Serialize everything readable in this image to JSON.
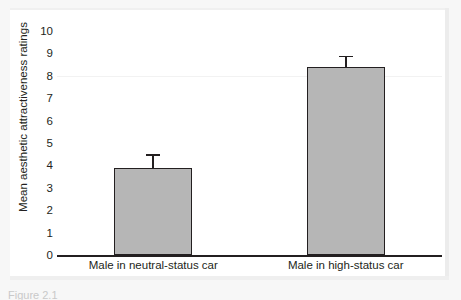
{
  "figure": {
    "caption": "Figure 2.1",
    "background_color": "#f7f7f7",
    "panel_color": "#ffffff"
  },
  "chart_data": {
    "type": "bar",
    "title": "",
    "subtitle": "",
    "xlabel": "",
    "ylabel": "Mean aesthetic attractiveness ratings",
    "categories": [
      "Male in neutral-status car",
      "Male in high-status car"
    ],
    "values": [
      3.9,
      8.4
    ],
    "errors": [
      0.6,
      0.5
    ],
    "error_type": "error bar",
    "ylim": [
      0,
      10
    ],
    "yticks": [
      0,
      1,
      2,
      3,
      4,
      5,
      6,
      7,
      8,
      9,
      10
    ],
    "ytick_labels": [
      "0",
      "1",
      "2",
      "3",
      "4",
      "5",
      "6",
      "7",
      "8",
      "9",
      "10"
    ],
    "grid": false,
    "legend": "none",
    "bar_color": "#b6b6b6",
    "bar_edge_color": "#231f20",
    "axis_color": "#231f20"
  }
}
